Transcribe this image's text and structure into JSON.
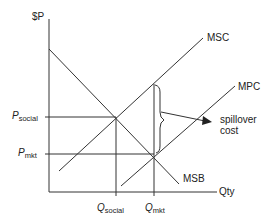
{
  "diagram": {
    "type": "economics-externality",
    "axes": {
      "y_label": "$P",
      "x_label": "Qty"
    },
    "curves": {
      "msc": "MSC",
      "mpc": "MPC",
      "msb": "MSB"
    },
    "prices": {
      "social": {
        "main": "P",
        "sub": "social"
      },
      "mkt": {
        "main": "P",
        "sub": "mkt"
      }
    },
    "quantities": {
      "social": {
        "main": "Q",
        "sub": "social"
      },
      "mkt": {
        "main": "Q",
        "sub": "mkt"
      }
    },
    "annotation": {
      "line1": "spillover",
      "line2": "cost"
    },
    "colors": {
      "line": "#333333",
      "background": "#ffffff"
    }
  }
}
